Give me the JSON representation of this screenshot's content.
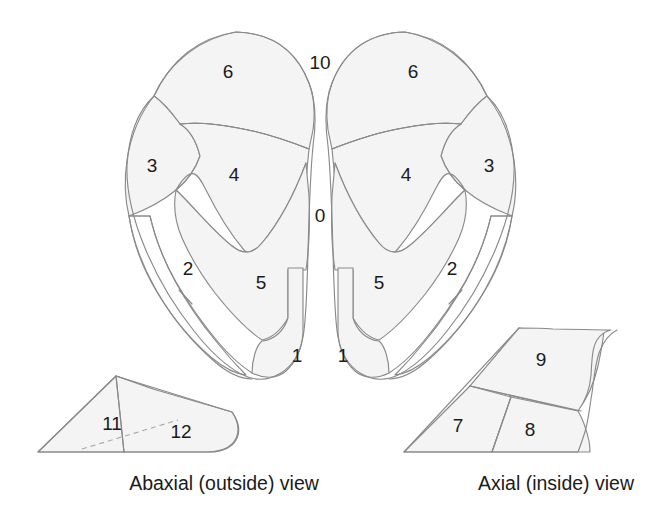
{
  "figure": {
    "background_color": "#ffffff",
    "zone_fill_color": "#f4f4f4",
    "stroke_color": "#8a8a8a",
    "label_color": "#1b1b1b"
  },
  "captions": [
    {
      "id": "abaxial",
      "text": "Abaxial (outside) view",
      "x": 224,
      "y": 484
    },
    {
      "id": "axial",
      "text": "Axial (inside) view",
      "x": 556,
      "y": 484
    }
  ],
  "sole_view": {
    "name": "solar surface view",
    "labels": [
      {
        "id": "left-zone-6",
        "text": "6",
        "x": 228,
        "y": 71
      },
      {
        "id": "left-zone-3",
        "text": "3",
        "x": 152,
        "y": 165
      },
      {
        "id": "left-zone-4",
        "text": "4",
        "x": 234,
        "y": 174
      },
      {
        "id": "left-zone-2",
        "text": "2",
        "x": 188,
        "y": 268
      },
      {
        "id": "left-zone-5",
        "text": "5",
        "x": 261,
        "y": 282
      },
      {
        "id": "left-zone-1",
        "text": "1",
        "x": 297,
        "y": 355
      },
      {
        "id": "interdigital-zone-10",
        "text": "10",
        "x": 320,
        "y": 62
      },
      {
        "id": "interdigital-zone-0",
        "text": "0",
        "x": 320,
        "y": 215
      },
      {
        "id": "right-zone-6",
        "text": "6",
        "x": 413,
        "y": 71
      },
      {
        "id": "right-zone-3",
        "text": "3",
        "x": 489,
        "y": 165
      },
      {
        "id": "right-zone-4",
        "text": "4",
        "x": 406,
        "y": 174
      },
      {
        "id": "right-zone-2",
        "text": "2",
        "x": 452,
        "y": 268
      },
      {
        "id": "right-zone-5",
        "text": "5",
        "x": 379,
        "y": 282
      },
      {
        "id": "right-zone-1",
        "text": "1",
        "x": 343,
        "y": 355
      }
    ]
  },
  "abaxial_view": {
    "name": "abaxial wall view",
    "labels": [
      {
        "id": "abaxial-zone-11",
        "text": "11",
        "x": 112,
        "y": 423
      },
      {
        "id": "abaxial-zone-12",
        "text": "12",
        "x": 181,
        "y": 431
      }
    ]
  },
  "axial_view": {
    "name": "axial wall view",
    "labels": [
      {
        "id": "axial-zone-9",
        "text": "9",
        "x": 541,
        "y": 359
      },
      {
        "id": "axial-zone-7",
        "text": "7",
        "x": 458,
        "y": 425
      },
      {
        "id": "axial-zone-8",
        "text": "8",
        "x": 530,
        "y": 429
      }
    ]
  },
  "zone_legend": {
    "zones_present": [
      "0",
      "1",
      "2",
      "3",
      "4",
      "5",
      "6",
      "7",
      "8",
      "9",
      "10",
      "11",
      "12"
    ]
  }
}
